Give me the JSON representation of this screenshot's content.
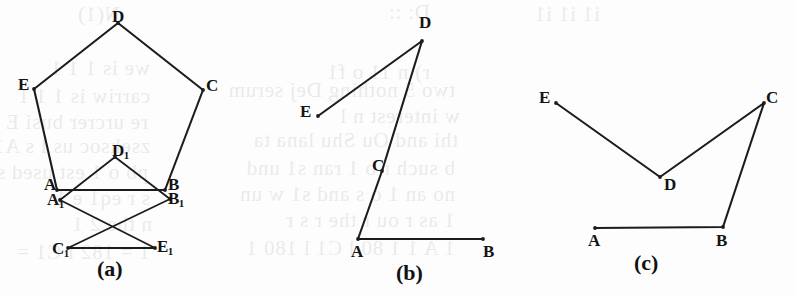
{
  "page": {
    "width": 795,
    "height": 296,
    "background_color": "#fdfdfd",
    "ink_color": "#1c1c1c"
  },
  "figures": [
    {
      "id": "figure-a",
      "caption": "(a)",
      "caption_pos": {
        "x": 97,
        "y": 258
      },
      "shapes": [
        {
          "name": "pentagon-ABCDE",
          "type": "polygon",
          "closed": true,
          "points": [
            [
              57,
              190
            ],
            [
              165,
              190
            ],
            [
              203,
              90
            ],
            [
              118,
              23
            ],
            [
              34,
              89
            ]
          ]
        },
        {
          "name": "pentagram-A1B1C1D1E1",
          "type": "star",
          "closed": true,
          "points": [
            [
              60,
              200
            ],
            [
              68,
              248
            ],
            [
              115,
              157
            ],
            [
              155,
              248
            ],
            [
              170,
              199
            ]
          ]
        }
      ],
      "vertices": [
        {
          "name": "vertex-D",
          "label": "D",
          "sub": "",
          "x": 112,
          "y": 8
        },
        {
          "name": "vertex-E",
          "label": "E",
          "sub": "",
          "x": 18,
          "y": 76
        },
        {
          "name": "vertex-C",
          "label": "C",
          "sub": "",
          "x": 206,
          "y": 77
        },
        {
          "name": "vertex-A",
          "label": "A",
          "sub": "",
          "x": 44,
          "y": 176
        },
        {
          "name": "vertex-B",
          "label": "B",
          "sub": "",
          "x": 168,
          "y": 176
        },
        {
          "name": "vertex-A1",
          "label": "A",
          "sub": "1",
          "x": 47,
          "y": 191
        },
        {
          "name": "vertex-B1",
          "label": "B",
          "sub": "1",
          "x": 168,
          "y": 190
        },
        {
          "name": "vertex-D1",
          "label": "D",
          "sub": "1",
          "x": 112,
          "y": 142
        },
        {
          "name": "vertex-C1",
          "label": "C",
          "sub": "1",
          "x": 52,
          "y": 240
        },
        {
          "name": "vertex-E1",
          "label": "E",
          "sub": "1",
          "x": 157,
          "y": 238
        }
      ]
    },
    {
      "id": "figure-b",
      "caption": "(b)",
      "caption_pos": {
        "x": 396,
        "y": 262
      },
      "shapes": [
        {
          "name": "polyline-EDCAB",
          "type": "polyline",
          "closed": false,
          "points": [
            [
              318,
              116
            ],
            [
              422,
              41
            ],
            [
              382,
              171
            ],
            [
              358,
              239
            ],
            [
              483,
              239
            ]
          ]
        }
      ],
      "vertices": [
        {
          "name": "vertex-D",
          "label": "D",
          "sub": "",
          "x": 419,
          "y": 14
        },
        {
          "name": "vertex-E",
          "label": "E",
          "sub": "",
          "x": 300,
          "y": 103
        },
        {
          "name": "vertex-C",
          "label": "C",
          "sub": "",
          "x": 372,
          "y": 157
        },
        {
          "name": "vertex-A",
          "label": "A",
          "sub": "",
          "x": 351,
          "y": 243
        },
        {
          "name": "vertex-B",
          "label": "B",
          "sub": "",
          "x": 483,
          "y": 243
        }
      ]
    },
    {
      "id": "figure-c",
      "caption": "(c)",
      "caption_pos": {
        "x": 634,
        "y": 252
      },
      "shapes": [
        {
          "name": "polyline-EDCBA",
          "type": "polyline",
          "closed": false,
          "points": [
            [
              556,
              103
            ],
            [
              660,
              177
            ],
            [
              764,
              103
            ],
            [
              723,
              227
            ],
            [
              595,
              228
            ]
          ]
        }
      ],
      "vertices": [
        {
          "name": "vertex-E",
          "label": "E",
          "sub": "",
          "x": 539,
          "y": 89
        },
        {
          "name": "vertex-C",
          "label": "C",
          "sub": "",
          "x": 766,
          "y": 89
        },
        {
          "name": "vertex-D",
          "label": "D",
          "sub": "",
          "x": 664,
          "y": 176
        },
        {
          "name": "vertex-A",
          "label": "A",
          "sub": "",
          "x": 588,
          "y": 232
        },
        {
          "name": "vertex-B",
          "label": "B",
          "sub": "",
          "x": 716,
          "y": 232
        }
      ]
    }
  ],
  "bleed_through_text": [
    {
      "text": "N(1)",
      "x": 120,
      "y": 4
    },
    {
      "text": "D:  ::",
      "x": 430,
      "y": 2
    },
    {
      "text": "i1      i1      i1",
      "x": 600,
      "y": 4
    },
    {
      "text": "we  is  1 1 1",
      "x": 150,
      "y": 58
    },
    {
      "text": "r) n  11 o  f1",
      "x": 430,
      "y": 62
    },
    {
      "text": "carriw   is  1 1 1",
      "x": 150,
      "y": 86
    },
    {
      "text": "two 5 nothing  Dej serum",
      "x": 455,
      "y": 80
    },
    {
      "text": "re  urcrer  busi  E",
      "x": 148,
      "y": 112
    },
    {
      "text": "w    interest  n    l",
      "x": 460,
      "y": 106
    },
    {
      "text": "zseksoc  us  l  s  A1",
      "x": 150,
      "y": 136
    },
    {
      "text": "thi  and  Ou  Shu  lana  ta",
      "x": 458,
      "y": 130
    },
    {
      "text": "pb  o  1  est  used  s1  stores",
      "x": 148,
      "y": 162
    },
    {
      "text": "b  such  r  b  1  ran  s1  und",
      "x": 455,
      "y": 158
    },
    {
      "text": "s  r  eq1  e  1",
      "x": 150,
      "y": 188
    },
    {
      "text": "no  an  1  o  s  and  s1  w  un",
      "x": 455,
      "y": 184
    },
    {
      "text": "n  the  2  1",
      "x": 152,
      "y": 214
    },
    {
      "text": "1  as  r  ou  r  the  r  s  r",
      "x": 455,
      "y": 210
    },
    {
      "text": "1 = 182  l  C1 =",
      "x": 150,
      "y": 242
    },
    {
      "text": "1  A  1  1  80  l  C1  l  180  1",
      "x": 455,
      "y": 238
    }
  ]
}
